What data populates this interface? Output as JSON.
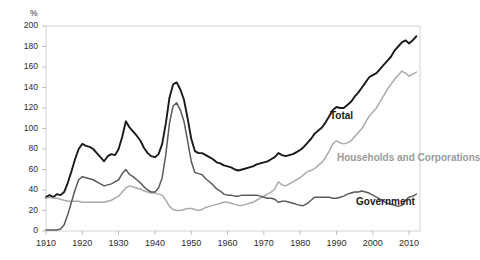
{
  "chart_data": {
    "type": "line",
    "title": "",
    "xlabel": "",
    "ylabel": "%",
    "unit_label": "%",
    "xlim": [
      1910,
      2013
    ],
    "ylim": [
      0,
      200
    ],
    "ytick_step": 20,
    "xtick_step": 10,
    "grid": false,
    "legend_position": "inline-annotations",
    "yticks": [
      "0",
      "20",
      "40",
      "60",
      "80",
      "100",
      "120",
      "140",
      "160",
      "180",
      "200"
    ],
    "xticks": [
      "1910",
      "1920",
      "1930",
      "1940",
      "1950",
      "1960",
      "1970",
      "1980",
      "1990",
      "2000",
      "2010"
    ],
    "annotations": [
      "Sources: Reserve Bank of Australia",
      "Australian Bureau of Statistics"
    ],
    "source_note": "Sources: Reserve Bank of Australia\nAustralian Bureau of Statistics",
    "colors": {
      "total": "#1a1a1a",
      "households_and_corporations": "#aaaaaa",
      "government": "#5a5a5a",
      "axis": "#b0b0b0",
      "background": "#ffffff"
    },
    "x": [
      1910,
      1911,
      1912,
      1913,
      1914,
      1915,
      1916,
      1917,
      1918,
      1919,
      1920,
      1921,
      1922,
      1923,
      1924,
      1925,
      1926,
      1927,
      1928,
      1929,
      1930,
      1931,
      1932,
      1933,
      1934,
      1935,
      1936,
      1937,
      1938,
      1939,
      1940,
      1941,
      1942,
      1943,
      1944,
      1945,
      1946,
      1947,
      1948,
      1949,
      1950,
      1951,
      1952,
      1953,
      1954,
      1955,
      1956,
      1957,
      1958,
      1959,
      1960,
      1961,
      1962,
      1963,
      1964,
      1965,
      1966,
      1967,
      1968,
      1969,
      1970,
      1971,
      1972,
      1973,
      1974,
      1975,
      1976,
      1977,
      1978,
      1979,
      1980,
      1981,
      1982,
      1983,
      1984,
      1985,
      1986,
      1987,
      1988,
      1989,
      1990,
      1991,
      1992,
      1993,
      1994,
      1995,
      1996,
      1997,
      1998,
      1999,
      2000,
      2001,
      2002,
      2003,
      2004,
      2005,
      2006,
      2007,
      2008,
      2009,
      2010,
      2011,
      2012
    ],
    "series": [
      {
        "name": "Total",
        "color": "#1a1a1a",
        "values": [
          33,
          35,
          33,
          36,
          35,
          38,
          47,
          58,
          70,
          80,
          85,
          83,
          82,
          80,
          76,
          72,
          68,
          73,
          75,
          74,
          80,
          92,
          107,
          101,
          97,
          93,
          88,
          81,
          76,
          73,
          72,
          75,
          85,
          105,
          130,
          143,
          145,
          138,
          128,
          110,
          90,
          78,
          76,
          76,
          74,
          72,
          70,
          67,
          66,
          64,
          63,
          62,
          60,
          59,
          60,
          61,
          62,
          63,
          65,
          66,
          67,
          68,
          70,
          72,
          76,
          74,
          73,
          74,
          75,
          77,
          79,
          82,
          86,
          90,
          95,
          98,
          101,
          106,
          112,
          118,
          121,
          120,
          120,
          123,
          126,
          131,
          135,
          140,
          145,
          150,
          152,
          154,
          158,
          162,
          166,
          170,
          176,
          180,
          184,
          186,
          183,
          186,
          190
        ]
      },
      {
        "name": "Households and Corporations",
        "color": "#aaaaaa",
        "values": [
          32,
          33,
          32,
          32,
          31,
          30,
          29,
          29,
          29,
          29,
          28,
          28,
          28,
          28,
          28,
          28,
          28,
          29,
          30,
          32,
          34,
          38,
          42,
          44,
          43,
          42,
          41,
          39,
          38,
          37,
          37,
          36,
          35,
          30,
          24,
          21,
          20,
          20,
          21,
          22,
          22,
          21,
          20,
          21,
          23,
          24,
          25,
          26,
          27,
          28,
          28,
          27,
          26,
          25,
          25,
          26,
          27,
          28,
          30,
          32,
          34,
          36,
          38,
          41,
          48,
          45,
          44,
          46,
          48,
          50,
          52,
          55,
          58,
          59,
          61,
          64,
          67,
          72,
          78,
          85,
          88,
          86,
          85,
          86,
          88,
          92,
          96,
          100,
          106,
          112,
          116,
          120,
          126,
          132,
          138,
          143,
          148,
          152,
          156,
          154,
          151,
          153,
          155
        ]
      },
      {
        "name": "Government",
        "color": "#5a5a5a",
        "values": [
          1,
          1,
          1,
          1,
          2,
          6,
          16,
          28,
          40,
          50,
          53,
          52,
          51,
          50,
          48,
          46,
          44,
          45,
          46,
          48,
          50,
          56,
          60,
          55,
          53,
          50,
          47,
          43,
          40,
          38,
          38,
          42,
          52,
          75,
          105,
          122,
          125,
          118,
          107,
          88,
          68,
          57,
          56,
          55,
          51,
          48,
          45,
          41,
          39,
          36,
          35,
          35,
          34,
          34,
          35,
          35,
          35,
          35,
          35,
          34,
          33,
          32,
          32,
          31,
          28,
          29,
          29,
          28,
          27,
          26,
          25,
          25,
          27,
          30,
          33,
          33,
          33,
          33,
          33,
          32,
          32,
          33,
          34,
          36,
          37,
          38,
          38,
          39,
          38,
          37,
          35,
          33,
          31,
          29,
          27,
          26,
          25,
          24,
          25,
          30,
          33,
          34,
          36
        ]
      }
    ]
  }
}
